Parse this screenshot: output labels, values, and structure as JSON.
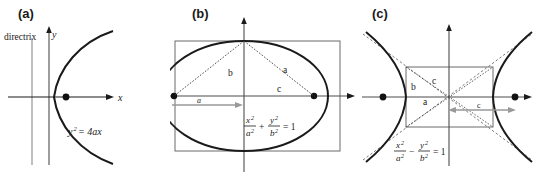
{
  "figure": {
    "background_color": "#ffffff",
    "curve_color": "#1a1a1a",
    "axis_color": "#1a1a1a",
    "guide_color": "#8c8c8c",
    "arrow_color": "#999999"
  },
  "panels": [
    {
      "id": "a",
      "label": "(a)",
      "conic": "parabola",
      "equation": "y² = 4ax",
      "equation_parts": {
        "lhs_base": "y",
        "lhs_exp": "2",
        "rhs": "= 4ax"
      },
      "axis_labels": {
        "x": "x",
        "y": "y"
      },
      "annotations": [
        {
          "name": "directrix-label",
          "text": "directrix"
        }
      ],
      "focus_count": 1
    },
    {
      "id": "b",
      "label": "(b)",
      "conic": "ellipse",
      "equation": "x²/a² + y²/b² = 1",
      "equation_parts": {
        "num1": "x",
        "num1_exp": "2",
        "den1": "a",
        "den1_exp": "2",
        "operator": "+",
        "num2": "y",
        "num2_exp": "2",
        "den2": "b",
        "den2_exp": "2",
        "rhs": "= 1"
      },
      "segment_labels": [
        {
          "name": "semi-minor-label",
          "text": "b"
        },
        {
          "name": "semi-major-label",
          "text": "a"
        },
        {
          "name": "focal-distance-label",
          "text": "c"
        }
      ],
      "measure_arrow_label": "a",
      "focus_count": 2
    },
    {
      "id": "c",
      "label": "(c)",
      "conic": "hyperbola",
      "equation": "x²/a² − y²/b² = 1",
      "equation_parts": {
        "num1": "x",
        "num1_exp": "2",
        "den1": "a",
        "den1_exp": "2",
        "operator": "−",
        "num2": "y",
        "num2_exp": "2",
        "den2": "b",
        "den2_exp": "2",
        "rhs": "= 1"
      },
      "segment_labels": [
        {
          "name": "conjugate-axis-label",
          "text": "b"
        },
        {
          "name": "diagonal-label",
          "text": "c"
        },
        {
          "name": "transverse-axis-label",
          "text": "a"
        }
      ],
      "measure_arrow_label": "c",
      "focus_count": 2
    }
  ]
}
